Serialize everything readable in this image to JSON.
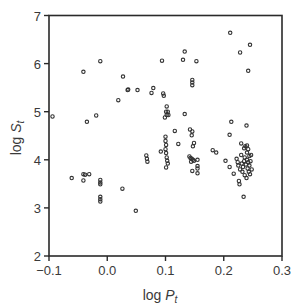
{
  "chart_data": {
    "type": "scatter",
    "title": "",
    "xlabel": "log P_t",
    "ylabel": "log S_t",
    "xlabel_parts": {
      "prefix": "log ",
      "var": "P",
      "sub": "t"
    },
    "ylabel_parts": {
      "prefix": "log ",
      "var": "S",
      "sub": "t"
    },
    "xlim": [
      -0.1,
      0.3
    ],
    "ylim": [
      2,
      7
    ],
    "xticks": [
      -0.1,
      0.0,
      0.1,
      0.2,
      0.3
    ],
    "xtick_labels": [
      "−0.1",
      "0.0",
      "0.1",
      "0.2",
      "0.3"
    ],
    "yticks": [
      2,
      3,
      4,
      5,
      6,
      7
    ],
    "ytick_labels": [
      "2",
      "3",
      "4",
      "5",
      "6",
      "7"
    ],
    "grid": false,
    "legend": null,
    "marker": "open-circle",
    "marker_color": "#333333",
    "series": [
      {
        "name": "observations",
        "points": [
          [
            -0.094,
            4.9
          ],
          [
            -0.061,
            3.62
          ],
          [
            -0.041,
            5.83
          ],
          [
            -0.041,
            3.7
          ],
          [
            -0.038,
            3.69
          ],
          [
            -0.031,
            3.7
          ],
          [
            -0.041,
            3.57
          ],
          [
            -0.035,
            4.79
          ],
          [
            -0.019,
            4.92
          ],
          [
            -0.012,
            6.05
          ],
          [
            -0.012,
            3.58
          ],
          [
            -0.012,
            3.53
          ],
          [
            -0.012,
            3.49
          ],
          [
            -0.012,
            3.23
          ],
          [
            -0.012,
            3.18
          ],
          [
            -0.012,
            3.13
          ],
          [
            0.019,
            5.24
          ],
          [
            0.026,
            3.4
          ],
          [
            0.027,
            5.73
          ],
          [
            0.035,
            5.45
          ],
          [
            0.036,
            5.46
          ],
          [
            0.049,
            2.94
          ],
          [
            0.052,
            5.45
          ],
          [
            0.067,
            4.09
          ],
          [
            0.068,
            4.02
          ],
          [
            0.069,
            3.96
          ],
          [
            0.076,
            5.39
          ],
          [
            0.079,
            5.49
          ],
          [
            0.092,
            4.17
          ],
          [
            0.094,
            6.06
          ],
          [
            0.096,
            5.38
          ],
          [
            0.097,
            5.33
          ],
          [
            0.099,
            4.88
          ],
          [
            0.1,
            4.48
          ],
          [
            0.1,
            4.39
          ],
          [
            0.101,
            4.31
          ],
          [
            0.1,
            4.22
          ],
          [
            0.101,
            4.14
          ],
          [
            0.102,
            4.05
          ],
          [
            0.103,
            3.98
          ],
          [
            0.104,
            3.92
          ],
          [
            0.101,
            3.84
          ],
          [
            0.102,
            5.11
          ],
          [
            0.101,
            5.0
          ],
          [
            0.104,
            5.0
          ],
          [
            0.102,
            4.93
          ],
          [
            0.105,
            4.93
          ],
          [
            0.116,
            4.6
          ],
          [
            0.122,
            4.33
          ],
          [
            0.13,
            6.08
          ],
          [
            0.133,
            6.25
          ],
          [
            0.133,
            4.95
          ],
          [
            0.142,
            4.63
          ],
          [
            0.146,
            4.59
          ],
          [
            0.145,
            4.51
          ],
          [
            0.146,
            5.66
          ],
          [
            0.146,
            5.61
          ],
          [
            0.146,
            5.55
          ],
          [
            0.149,
            4.35
          ],
          [
            0.147,
            4.28
          ],
          [
            0.141,
            4.07
          ],
          [
            0.143,
            4.04
          ],
          [
            0.145,
            4.02
          ],
          [
            0.147,
            4.0
          ],
          [
            0.144,
            3.96
          ],
          [
            0.149,
            3.98
          ],
          [
            0.146,
            3.77
          ],
          [
            0.153,
            6.05
          ],
          [
            0.155,
            4.0
          ],
          [
            0.155,
            3.87
          ],
          [
            0.155,
            3.82
          ],
          [
            0.155,
            3.72
          ],
          [
            0.181,
            4.2
          ],
          [
            0.187,
            4.15
          ],
          [
            0.203,
            3.98
          ],
          [
            0.21,
            4.52
          ],
          [
            0.21,
            3.85
          ],
          [
            0.211,
            6.64
          ],
          [
            0.213,
            4.79
          ],
          [
            0.217,
            3.71
          ],
          [
            0.222,
            4.02
          ],
          [
            0.224,
            3.95
          ],
          [
            0.225,
            3.88
          ],
          [
            0.226,
            3.56
          ],
          [
            0.227,
            3.49
          ],
          [
            0.228,
            6.23
          ],
          [
            0.228,
            3.8
          ],
          [
            0.23,
            4.34
          ],
          [
            0.23,
            4.1
          ],
          [
            0.231,
            3.92
          ],
          [
            0.232,
            3.75
          ],
          [
            0.233,
            3.85
          ],
          [
            0.234,
            3.23
          ],
          [
            0.235,
            4.24
          ],
          [
            0.235,
            3.97
          ],
          [
            0.236,
            4.05
          ],
          [
            0.236,
            3.68
          ],
          [
            0.237,
            4.28
          ],
          [
            0.238,
            3.9
          ],
          [
            0.239,
            4.71
          ],
          [
            0.239,
            3.62
          ],
          [
            0.24,
            4.3
          ],
          [
            0.24,
            4.15
          ],
          [
            0.24,
            4.0
          ],
          [
            0.241,
            3.82
          ],
          [
            0.242,
            5.85
          ],
          [
            0.242,
            4.22
          ],
          [
            0.242,
            3.95
          ],
          [
            0.243,
            3.75
          ],
          [
            0.244,
            4.08
          ],
          [
            0.244,
            3.88
          ],
          [
            0.245,
            6.39
          ],
          [
            0.245,
            3.7
          ],
          [
            0.246,
            3.97
          ],
          [
            0.247,
            4.1
          ],
          [
            0.248,
            3.8
          ]
        ]
      }
    ]
  }
}
